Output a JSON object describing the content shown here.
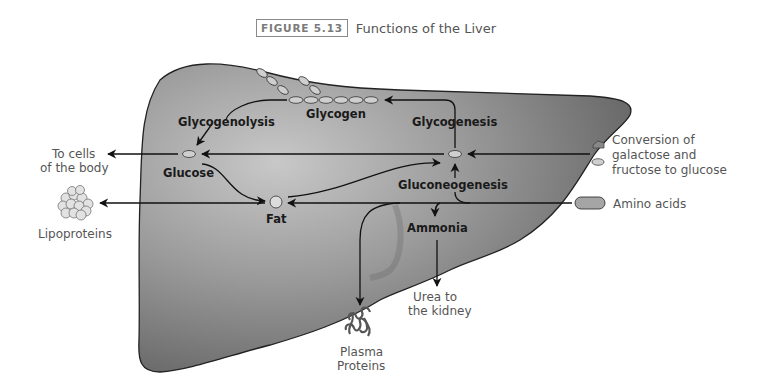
{
  "caption": {
    "figure_number": "FIGURE 5.13",
    "title": "Functions of the Liver"
  },
  "diagram": {
    "organ": "liver",
    "colors": {
      "liver_light": "#c4c4c4",
      "liver_dark": "#5a5a5a",
      "outline": "#222222",
      "arrow": "#111111",
      "inner_text": "#1a1a1a",
      "outer_text": "#555555",
      "molecule_fill": "#cfcfcf"
    },
    "internal_labels": {
      "glycogen": "Glycogen",
      "glycogenolysis": "Glycogenolysis",
      "glycogenesis": "Glycogenesis",
      "glucose": "Glucose",
      "fat": "Fat",
      "gluconeogenesis": "Gluconeogenesis",
      "ammonia": "Ammonia"
    },
    "external_labels": {
      "to_cells_line1": "To cells",
      "to_cells_line2": "of the body",
      "lipoproteins": "Lipoproteins",
      "conversion_line1": "Conversion of",
      "conversion_line2": "galactose and",
      "conversion_line3": "fructose to glucose",
      "amino_acids": "Amino acids",
      "urea_line1": "Urea to",
      "urea_line2": "the kidney",
      "plasma_line1": "Plasma",
      "plasma_line2": "Proteins"
    },
    "pathways": [
      {
        "from": "Glucose",
        "to": "Glycogen",
        "process": "Glycogenesis"
      },
      {
        "from": "Glycogen",
        "to": "Glucose",
        "process": "Glycogenolysis"
      },
      {
        "from": "Glucose",
        "to": "To cells of the body"
      },
      {
        "from": "Glucose",
        "to": "Fat"
      },
      {
        "from": "Fat",
        "to": "Glucose"
      },
      {
        "from": "Fat",
        "to": "Lipoproteins"
      },
      {
        "from": "Galactose and fructose",
        "to": "Glucose"
      },
      {
        "from": "Amino acids",
        "to": "Glucose",
        "process": "Gluconeogenesis"
      },
      {
        "from": "Amino acids",
        "to": "Fat"
      },
      {
        "from": "Amino acids",
        "to": "Ammonia"
      },
      {
        "from": "Ammonia",
        "to": "Urea to the kidney"
      },
      {
        "from": "Amino acids",
        "to": "Plasma Proteins"
      }
    ]
  }
}
